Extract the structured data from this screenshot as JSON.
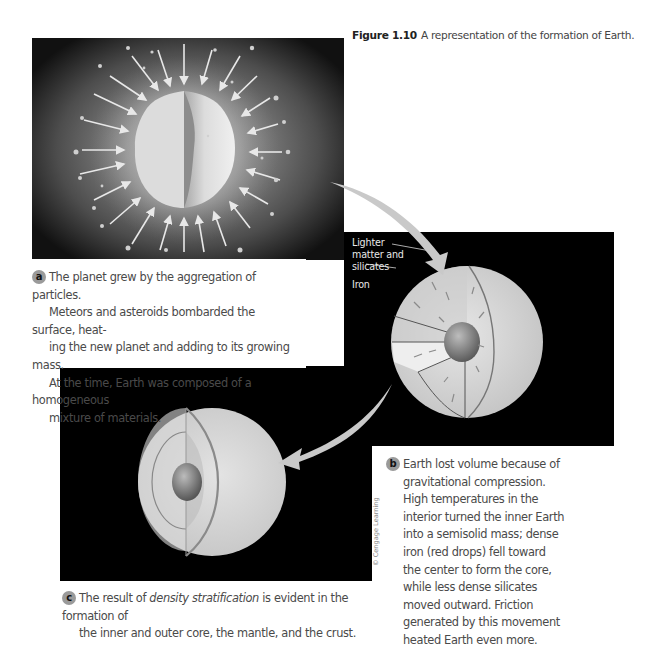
{
  "figure": {
    "number": "Figure 1.10",
    "title": "A representation of the formation of Earth."
  },
  "panels": {
    "a": {
      "badge": "a",
      "text": "The planet grew by the aggregation of particles. Meteors and asteroids bombarded the surface, heat-ing the new planet and adding to its growing mass. At the time, Earth was composed of a homogeneous mixture of materials.",
      "lines": [
        "The planet grew by the aggregation of particles.",
        "Meteors and asteroids bombarded the surface, heat-",
        "ing the new planet and adding to its growing mass.",
        "At the time, Earth was composed of a homogeneous",
        "mixture of materials."
      ]
    },
    "b": {
      "badge": "b",
      "labels": {
        "lighter": [
          "Lighter",
          "matter and",
          "silicates"
        ],
        "iron": "Iron"
      },
      "lines": [
        "Earth lost volume because of",
        "gravitational compression.",
        "High temperatures in the",
        "interior turned the inner Earth",
        "into a semisolid mass; dense",
        "iron (red drops) fell toward",
        "the center to form the core,",
        "while less dense silicates",
        "moved outward. Friction",
        "generated by this movement",
        "heated Earth even more."
      ]
    },
    "c": {
      "badge": "c",
      "line1_pre": "The result of ",
      "line1_em": "density stratification",
      "line1_post": " is evident in the formation of",
      "line2": "the inner and outer core, the mantle, and the crust."
    }
  },
  "credit": "© Cengage Learning",
  "colors": {
    "panel_bg": "#000000",
    "sphere": "#d6d6d6",
    "core": "#7a7a7a",
    "arrow": "#c8c8c8",
    "badge": "#9a9a9a"
  }
}
